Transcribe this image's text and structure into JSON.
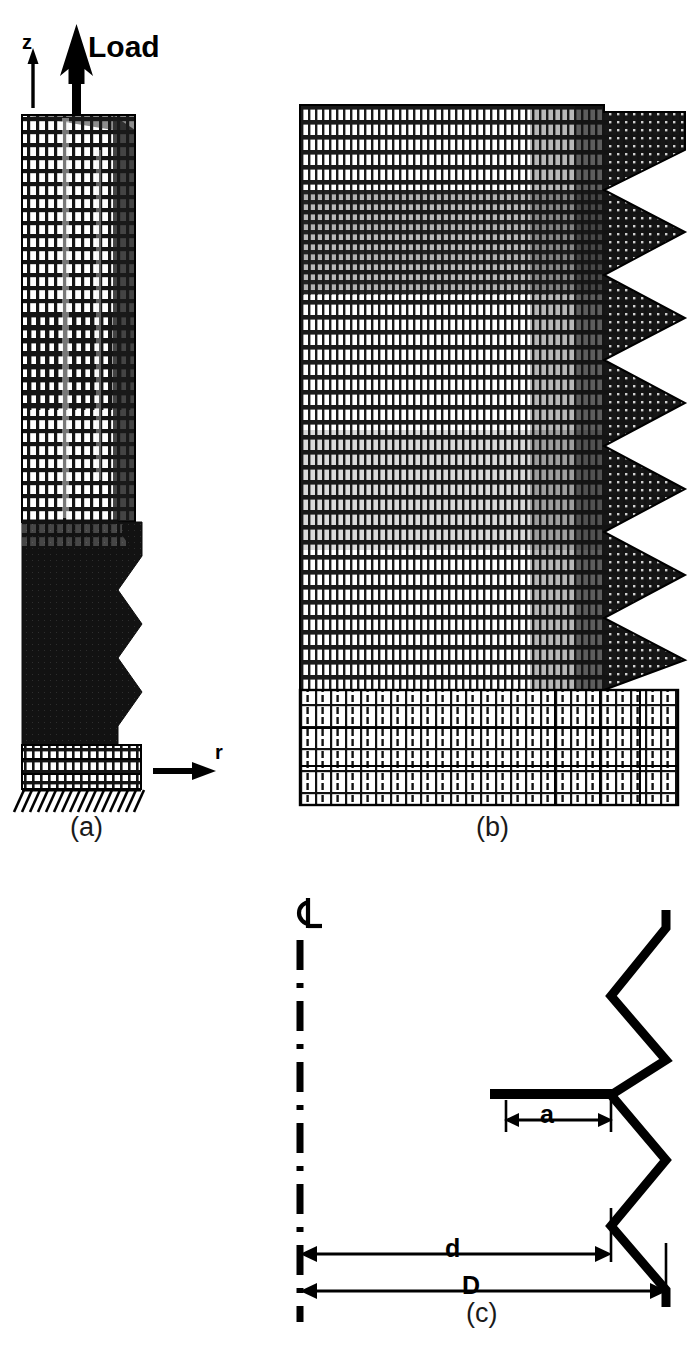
{
  "figure": {
    "type": "technical-figure",
    "background_color": "#ffffff",
    "ink_color": "#000000"
  },
  "panels": [
    {
      "id": "a",
      "caption": "(a)",
      "caption_x": 92,
      "caption_y": 831,
      "kind": "fe-mesh-full-model",
      "mesh_bounds": {
        "x": 22,
        "y": 115,
        "width": 122,
        "height": 690
      },
      "annotations": {
        "axis_z": {
          "label": "z",
          "x": 27,
          "y": 46
        },
        "axis_r": {
          "label": "r",
          "x": 222,
          "y": 770
        },
        "load": {
          "label": "Load",
          "x": 88,
          "y": 50
        }
      },
      "regions": {
        "upper_mesh_rows": 26,
        "upper_mesh_cols": 14,
        "thread_teeth": 5,
        "base_mesh_rows": 3
      }
    },
    {
      "id": "b",
      "caption": "(b)",
      "caption_x": 482,
      "caption_y": 831,
      "kind": "fe-mesh-detail",
      "mesh_bounds": {
        "x": 300,
        "y": 105,
        "width": 385,
        "height": 700
      },
      "regions": {
        "fine_mesh_rows": 46,
        "fine_mesh_cols": 54,
        "thread_teeth": 5,
        "base_block_rows": 6,
        "base_block_cols": 26
      }
    },
    {
      "id": "c",
      "caption": "(c)",
      "caption_x": 476,
      "caption_y": 1318,
      "kind": "dimension-diagram",
      "centerline": {
        "symbol": "centerline-symbol",
        "symbol_x": 294,
        "symbol_y": 898,
        "line_x": 300,
        "line_top": 940,
        "line_bottom": 1320
      },
      "dimensions": [
        {
          "name": "a",
          "label": "a",
          "label_x": 547,
          "label_y": 1113,
          "y": 1120,
          "x1": 506,
          "x2": 611
        },
        {
          "name": "d",
          "label": "d",
          "label_x": 452,
          "label_y": 1243,
          "y": 1254,
          "x1": 300,
          "x2": 611
        },
        {
          "name": "D",
          "label": "D",
          "label_x": 470,
          "label_y": 1281,
          "y": 1291,
          "x1": 300,
          "x2": 666
        }
      ],
      "thread_profile": {
        "crest_x": 666,
        "root_x": 611,
        "shank_line_y": 1095,
        "teeth": 3
      }
    }
  ],
  "colors": {
    "ink": "#000000",
    "mesh_line": "#1a1a1a",
    "paper": "#ffffff",
    "dark_fill": "#141414"
  }
}
